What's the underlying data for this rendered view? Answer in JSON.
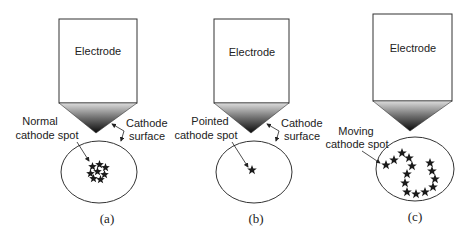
{
  "figure": {
    "panels": [
      {
        "id": "a",
        "caption": "(a)",
        "electrode_label": "Electrode",
        "spot_label_line1": "Normal",
        "spot_label_line2": "cathode spot",
        "surface_label_line1": "Cathode",
        "surface_label_line2": "surface",
        "spot_type": "normal"
      },
      {
        "id": "b",
        "caption": "(b)",
        "electrode_label": "Electrode",
        "spot_label_line1": "Pointed",
        "spot_label_line2": "cathode spot",
        "surface_label_line1": "Cathode",
        "surface_label_line2": "surface",
        "spot_type": "pointed"
      },
      {
        "id": "c",
        "caption": "(c)",
        "electrode_label": "Electrode",
        "spot_label_line1": "Moving",
        "spot_label_line2": "cathode spot",
        "spot_type": "moving"
      }
    ]
  },
  "colors": {
    "line": "#333333",
    "tip_top": "#d8d8d8",
    "tip_bottom": "#111111",
    "star": "#1a1a1a"
  }
}
